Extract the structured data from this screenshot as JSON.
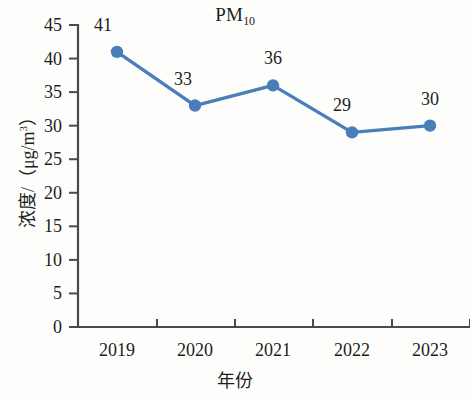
{
  "chart_data": {
    "type": "line",
    "title": "PM10",
    "title_base": "PM",
    "title_sub": "10",
    "xlabel": "年份",
    "ylabel": "浓度/（μg/m³）",
    "ylabel_base": "浓度/（μg/m",
    "ylabel_sup": "3",
    "ylabel_tail": "）",
    "categories": [
      "2019",
      "2020",
      "2021",
      "2022",
      "2023"
    ],
    "values": [
      41,
      33,
      36,
      29,
      30
    ],
    "point_labels": [
      "41",
      "33",
      "36",
      "29",
      "30"
    ],
    "ylim": [
      0,
      45
    ],
    "ytick_step": 5,
    "yticks": [
      "45",
      "40",
      "35",
      "30",
      "25",
      "20",
      "15",
      "10",
      "5",
      "0"
    ],
    "grid": false,
    "legend": "none",
    "series": [
      {
        "name": "PM10",
        "values": [
          41,
          33,
          36,
          29,
          30
        ],
        "color": "#4a7ebb",
        "marker": "circle",
        "line_width": 3
      }
    ],
    "colors": {
      "line": "#4a7ebb",
      "marker": "#4a7ebb",
      "axis": "#4a4a48",
      "text": "#1d1d1d",
      "background": "#fdfdfc"
    }
  }
}
